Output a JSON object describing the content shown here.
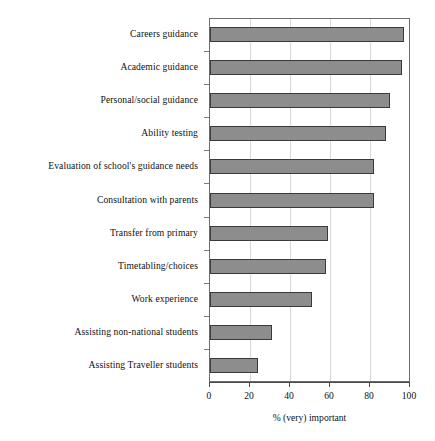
{
  "chart_data": {
    "type": "bar",
    "orientation": "horizontal",
    "title": "",
    "subtitle": "",
    "xlabel": "% (very) important",
    "ylabel": "",
    "xlim": [
      0,
      100
    ],
    "xticks": [
      0,
      20,
      40,
      60,
      80,
      100
    ],
    "xtick_labels": [
      "0",
      "20",
      "40",
      "60",
      "80",
      "100"
    ],
    "grid": "vertical",
    "legend": null,
    "bar_fill_color": "#8d8d8d",
    "bar_edge_color": "#3a3a3a",
    "frame_color": "#6d6d6d",
    "categories": [
      "Careers guidance",
      "Academic guidance",
      "Personal/social guidance",
      "Ability testing",
      "Evaluation of school's guidance needs",
      "Consultation with parents",
      "Transfer from primary",
      "Timetabling/choices",
      "Work experience",
      "Assisting non-national students",
      "Assisting Traveller students"
    ],
    "values": [
      97,
      96,
      90,
      88,
      82,
      82,
      59,
      58,
      51,
      31,
      24
    ]
  }
}
